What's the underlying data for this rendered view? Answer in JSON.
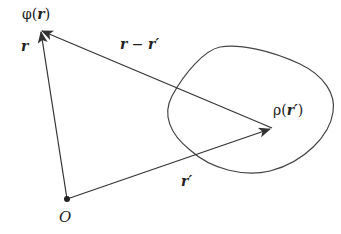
{
  "diagram": {
    "colors": {
      "stroke": "#333333",
      "text": "#222222",
      "background": "#ffffff"
    },
    "labels": {
      "phi": "φ",
      "phi_open": "(",
      "phi_arg": "r",
      "phi_close": ")",
      "r_vec": "r",
      "r_minus_rprime_a": "r",
      "r_minus_rprime_op": " − ",
      "r_minus_rprime_b": "r′",
      "rho": "ρ",
      "rho_open": "(",
      "rho_arg": "r′",
      "rho_close": ")",
      "rprime_vec": "r′",
      "origin": "O"
    },
    "points": {
      "origin": [
        67,
        199
      ],
      "field_point": [
        40,
        30
      ],
      "source_point": [
        272,
        128
      ]
    },
    "vectors": [
      {
        "name": "r",
        "from": "origin",
        "to": "field_point"
      },
      {
        "name": "r'",
        "from": "origin",
        "to": "source_point"
      },
      {
        "name": "r - r'",
        "from": "source_point",
        "to": "field_point"
      }
    ]
  }
}
